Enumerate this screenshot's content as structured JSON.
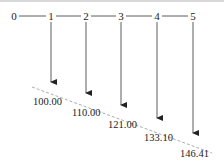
{
  "diagram": {
    "type": "cash-flow timeline",
    "periods": [
      {
        "label": "0",
        "x": 14
      },
      {
        "label": "1",
        "x": 51
      },
      {
        "label": "2",
        "x": 86
      },
      {
        "label": "3",
        "x": 121
      },
      {
        "label": "4",
        "x": 157
      },
      {
        "label": "5",
        "x": 193
      }
    ],
    "flows": [
      {
        "period": "1",
        "value": "100.00",
        "x": 51,
        "arrow_end_y": 88,
        "label_x": 33,
        "label_y": 105
      },
      {
        "period": "2",
        "value": "110.00",
        "x": 86,
        "arrow_end_y": 99,
        "label_x": 72,
        "label_y": 116
      },
      {
        "period": "3",
        "value": "121.00",
        "x": 121,
        "arrow_end_y": 111,
        "label_x": 108,
        "label_y": 128
      },
      {
        "period": "4",
        "value": "133.10",
        "x": 157,
        "arrow_end_y": 124,
        "label_x": 144,
        "label_y": 141
      },
      {
        "period": "5",
        "value": "146.41",
        "x": 193,
        "arrow_end_y": 139,
        "label_x": 180,
        "label_y": 157
      }
    ],
    "colors": {
      "line": "#333333",
      "dash": "#888888",
      "text": "#222222"
    }
  }
}
